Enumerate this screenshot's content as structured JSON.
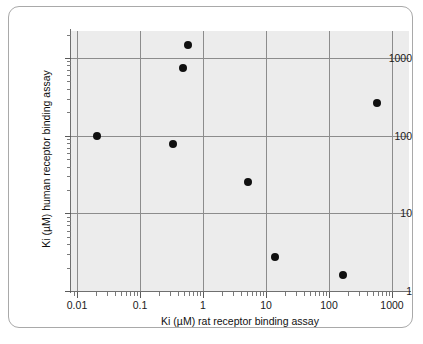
{
  "figure": {
    "background_color": "#ffffff",
    "plot_background_color": "#ececec",
    "grid_color": "#8c8c8c",
    "marker_color": "#101010"
  },
  "chart_data": {
    "type": "scatter",
    "title": "",
    "xlabel": "Ki (µM) rat receptor binding assay",
    "ylabel": "Ki (µM) human receptor binding assay",
    "xscale": "log",
    "yscale": "log",
    "xlim": [
      0.005,
      2000
    ],
    "ylim": [
      1,
      2000
    ],
    "grid": true,
    "legend": null,
    "xticks": [
      "0.01",
      "0.1",
      "1",
      "10",
      "100",
      "1000"
    ],
    "xtick_values": [
      0.01,
      0.1,
      1,
      10,
      100,
      1000
    ],
    "yticks": [
      "1",
      "10",
      "100",
      "1000"
    ],
    "ytick_values": [
      1,
      10,
      100,
      1000
    ],
    "points": [
      {
        "x": 0.021,
        "y": 100
      },
      {
        "x": 0.33,
        "y": 77
      },
      {
        "x": 0.48,
        "y": 740
      },
      {
        "x": 0.58,
        "y": 1450
      },
      {
        "x": 5.2,
        "y": 25
      },
      {
        "x": 14,
        "y": 2.7
      },
      {
        "x": 168,
        "y": 1.6
      },
      {
        "x": 570,
        "y": 260
      }
    ]
  }
}
